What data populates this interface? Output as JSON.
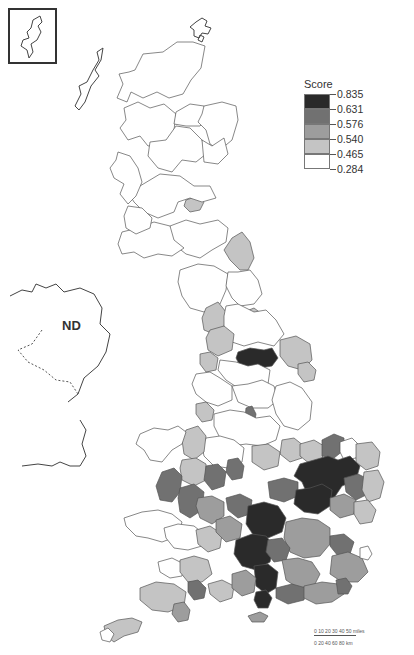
{
  "map": {
    "title": "Score by local authority district, Great Britain",
    "inset_label": "Shetland inset",
    "nd_label": "ND",
    "colors": {
      "class_1": "#ffffff",
      "class_2": "#c4c4c4",
      "class_3": "#9d9d9d",
      "class_4": "#717171",
      "class_5": "#2a2a2a",
      "outline": "#555555"
    }
  },
  "legend": {
    "title": "Score",
    "breaks": [
      "0.835",
      "0.631",
      "0.576",
      "0.540",
      "0.465",
      "0.284"
    ],
    "classes": [
      {
        "range": "0.631 – 0.835",
        "color": "#2a2a2a"
      },
      {
        "range": "0.576 – 0.631",
        "color": "#717171"
      },
      {
        "range": "0.540 – 0.576",
        "color": "#9d9d9d"
      },
      {
        "range": "0.465 – 0.540",
        "color": "#c4c4c4"
      },
      {
        "range": "0.284 – 0.465",
        "color": "#ffffff"
      }
    ]
  },
  "scalebar": {
    "miles_ticks": "0  10  20  30  40  50 miles",
    "km_ticks": "0   20   40   60   80 km"
  }
}
